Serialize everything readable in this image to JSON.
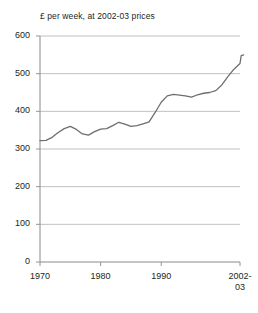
{
  "chart_data": {
    "type": "line",
    "title": "£ per week, at 2002-03 prices",
    "xlabel": "",
    "ylabel": "",
    "xlim": [
      1970,
      2003
    ],
    "ylim": [
      0,
      600
    ],
    "grid": true,
    "legend": null,
    "yticks": [
      0,
      100,
      200,
      300,
      400,
      500,
      600
    ],
    "ytick_labels": [
      "0",
      "100",
      "200",
      "300",
      "400",
      "500",
      "600"
    ],
    "xticks": [
      1970,
      1980,
      1990,
      2003
    ],
    "xtick_labels": [
      "1970",
      "1980",
      "1990",
      "2002-\n03"
    ],
    "line_color": "#6e6e6e",
    "series": [
      {
        "name": "Average household income",
        "x": [
          1970,
          1971,
          1972,
          1973,
          1974,
          1975,
          1976,
          1977,
          1978,
          1979,
          1980,
          1981,
          1982,
          1983,
          1984,
          1985,
          1986,
          1987,
          1988,
          1989,
          1990,
          1991,
          1992,
          1993,
          1994,
          1995,
          1996,
          1997,
          1998,
          1999,
          2000,
          2001,
          2002,
          2003
        ],
        "values": [
          322,
          323,
          331,
          344,
          354,
          360,
          352,
          340,
          337,
          346,
          353,
          354,
          362,
          371,
          366,
          360,
          362,
          367,
          372,
          397,
          424,
          441,
          445,
          443,
          441,
          438,
          444,
          448,
          450,
          455,
          470,
          492,
          512,
          527
        ]
      }
    ],
    "series_tail": {
      "x": [
        2003.2,
        2003.6
      ],
      "values": [
        548,
        550
      ]
    }
  },
  "axis": {
    "y_axis_name": "y-axis",
    "x_axis_name": "x-axis"
  }
}
